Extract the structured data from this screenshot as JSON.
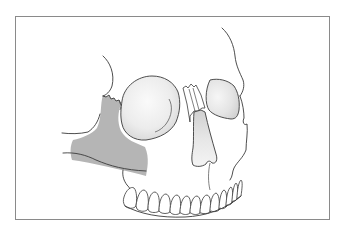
{
  "figure": {
    "highlighted_region": "zygomatic-maxillary-area",
    "colors": {
      "background": "#ffffff",
      "frame": "#8a8a8a",
      "outline": "#3a3a3a",
      "highlight_fill": "#b5b5b5",
      "orbit_fill_light": "#f4f4f4",
      "orbit_fill_dark": "#d6d6d6"
    }
  }
}
